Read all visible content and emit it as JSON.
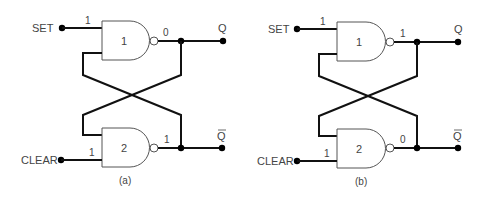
{
  "diagram": {
    "type": "NAND latch (SR flip-flop) states",
    "circuits": [
      {
        "caption": "(a)",
        "inputs": {
          "set_label": "SET",
          "clear_label": "CLEAR",
          "set_value": "1",
          "clear_value": "1"
        },
        "gates": [
          {
            "id": "1",
            "label": "1",
            "output_value": "0"
          },
          {
            "id": "2",
            "label": "2",
            "output_value": "1"
          }
        ],
        "outputs": {
          "q_label": "Q",
          "qbar_label": "Q"
        }
      },
      {
        "caption": "(b)",
        "inputs": {
          "set_label": "SET",
          "clear_label": "CLEAR",
          "set_value": "1",
          "clear_value": "1"
        },
        "gates": [
          {
            "id": "1",
            "label": "1",
            "output_value": "1"
          },
          {
            "id": "2",
            "label": "2",
            "output_value": "0"
          }
        ],
        "outputs": {
          "q_label": "Q",
          "qbar_label": "Q"
        }
      }
    ]
  }
}
